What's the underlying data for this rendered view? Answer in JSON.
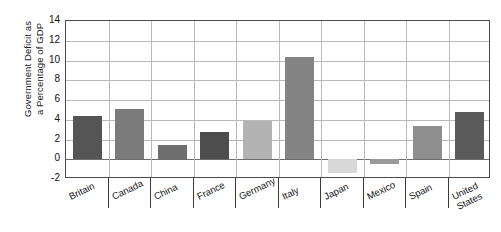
{
  "chart_data": {
    "type": "bar",
    "title": "",
    "subtitle": "",
    "xlabel": "",
    "ylabel": "Government Deficit as a Percentage of GDP",
    "ylabel_lines": [
      "Government Deficit as",
      "a Percentage of GDP"
    ],
    "ylim": [
      -2,
      14
    ],
    "ytick_step": 2,
    "ytick_labels": [
      "14",
      "12",
      "10",
      "8",
      "6",
      "4",
      "2",
      "0",
      "-2"
    ],
    "ytick_values": [
      14,
      12,
      10,
      8,
      6,
      4,
      2,
      0,
      -2
    ],
    "grid": "both",
    "legend": "none",
    "categories": [
      "Britain",
      "Canada",
      "China",
      "France",
      "Germany",
      "Italy",
      "Japan",
      "Mexico",
      "Spain",
      "United States"
    ],
    "category_label_lines": [
      [
        "Britain"
      ],
      [
        "Canada"
      ],
      [
        "China"
      ],
      [
        "France"
      ],
      [
        "Germany"
      ],
      [
        "Italy"
      ],
      [
        "Japan"
      ],
      [
        "Mexico"
      ],
      [
        "Spain"
      ],
      [
        "United",
        "States"
      ]
    ],
    "values": [
      4.4,
      5.1,
      1.4,
      2.8,
      3.9,
      10.4,
      -1.4,
      -0.5,
      3.4,
      4.8
    ],
    "bar_colors": [
      "#555555",
      "#7b7b7b",
      "#6e6e6e",
      "#4d4d4d",
      "#b3b3b3",
      "#848484",
      "#d8d8d8",
      "#9a9a9a",
      "#8f8f8f",
      "#5a5a5a"
    ]
  },
  "axis": {
    "frame_color": "#4a4a4a",
    "grid_color": "#b9b9b9",
    "zero_line_color": "#6d6d6d"
  }
}
